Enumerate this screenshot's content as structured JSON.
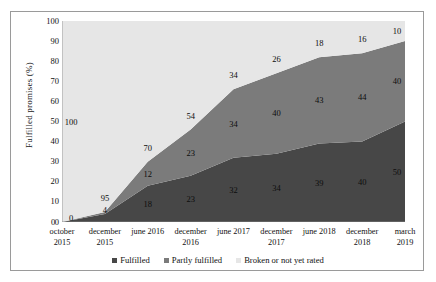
{
  "chart_data": {
    "type": "area",
    "title": "",
    "xlabel": "",
    "ylabel": "Fulfilled promises (%)",
    "ylim": [
      0,
      100
    ],
    "grid": false,
    "stacked": true,
    "legend_position": "bottom",
    "categories": [
      "october 2015",
      "december 2015",
      "june 2016",
      "december 2016",
      "june 2017",
      "december 2017",
      "june 2018",
      "december 2018",
      "march 2019"
    ],
    "category_lines": [
      [
        "october",
        "2015"
      ],
      [
        "december",
        "2015"
      ],
      [
        "june 2016",
        ""
      ],
      [
        "december",
        "2016"
      ],
      [
        "june 2017",
        ""
      ],
      [
        "december",
        "2017"
      ],
      [
        "june 2018",
        ""
      ],
      [
        "december",
        "2018"
      ],
      [
        "march",
        "2019"
      ]
    ],
    "series": [
      {
        "name": "Fulfilled",
        "color": "#474747",
        "values": [
          0,
          4,
          18,
          23,
          32,
          34,
          39,
          40,
          50
        ],
        "labels": [
          "0",
          "4",
          "18",
          "23",
          "32",
          "34",
          "39",
          "40",
          "50"
        ]
      },
      {
        "name": "Partly fulfilled",
        "color": "#7b7b7b",
        "values": [
          0,
          1,
          12,
          23,
          34,
          40,
          43,
          44,
          40
        ],
        "labels": [
          "",
          "",
          "12",
          "23",
          "34",
          "40",
          "43",
          "44",
          "40"
        ]
      },
      {
        "name": "Broken or not yet rated",
        "color": "#e6e6e6",
        "values": [
          100,
          95,
          70,
          54,
          34,
          26,
          18,
          16,
          10
        ],
        "labels": [
          "100",
          "95",
          "70",
          "54",
          "34",
          "26",
          "18",
          "16",
          "10"
        ]
      }
    ],
    "y_ticks": [
      "0",
      "10",
      "20",
      "30",
      "40",
      "50",
      "60",
      "70",
      "80",
      "90",
      "100"
    ],
    "axis_origin_label": "0"
  },
  "legend": {
    "items": [
      {
        "label": "Fulfilled",
        "color": "#474747"
      },
      {
        "label": "Partly fulfilled",
        "color": "#7b7b7b"
      },
      {
        "label": "Broken or not yet rated",
        "color": "#e6e6e6"
      }
    ]
  }
}
